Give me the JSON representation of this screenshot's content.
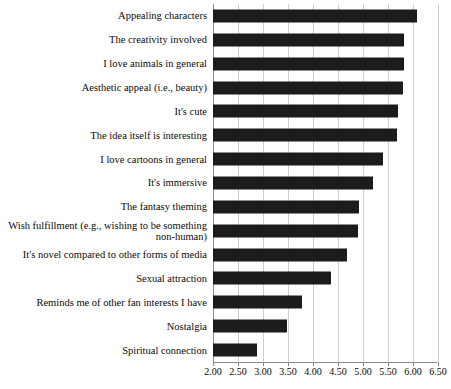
{
  "chart_data": {
    "type": "bar",
    "orientation": "horizontal",
    "title": "",
    "xlabel": "",
    "ylabel": "",
    "xlim": [
      2.0,
      6.5
    ],
    "xticks": [
      "2.00",
      "2.50",
      "3.00",
      "3.50",
      "4.00",
      "4.50",
      "5.00",
      "5.50",
      "6.00",
      "6.50"
    ],
    "xtick_values": [
      2.0,
      2.5,
      3.0,
      3.5,
      4.0,
      4.5,
      5.0,
      5.5,
      6.0,
      6.5
    ],
    "grid": "vertical",
    "legend": "none",
    "bar_color": "#1c1c1c",
    "categories": [
      "Appealing characters",
      "The creativity involved",
      "I love animals in general",
      "Aesthetic appeal (i.e., beauty)",
      "It's cute",
      "The idea itself is interesting",
      "I love cartoons in general",
      "It's immersive",
      "The fantasy theming",
      "Wish fulfillment (e.g., wishing to be something non-human)",
      "It's novel compared to other forms of media",
      "Sexual attraction",
      "Reminds me of other fan interests I have",
      "Nostalgia",
      "Spiritual connection"
    ],
    "values": [
      6.08,
      5.82,
      5.82,
      5.8,
      5.7,
      5.68,
      5.4,
      5.2,
      4.92,
      4.9,
      4.68,
      4.36,
      3.78,
      3.48,
      2.88
    ]
  }
}
